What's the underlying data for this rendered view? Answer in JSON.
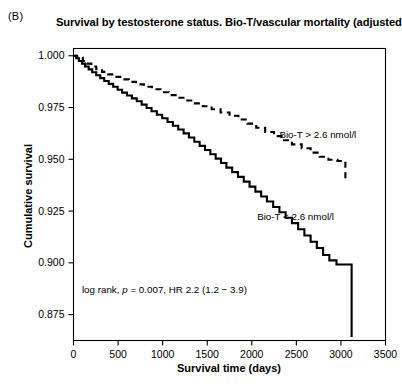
{
  "panel": {
    "label": "(B)"
  },
  "chart_data": {
    "type": "line",
    "subtype": "kaplan-meier-survival",
    "title": "Survival by testosterone status. Bio-T/vascular mortality (adjusted)",
    "xlabel": "Survival time (days)",
    "ylabel": "Cumulative survival",
    "xlim": [
      0,
      3500
    ],
    "ylim": [
      0.8625,
      1.0035
    ],
    "xticks": [
      0,
      500,
      1000,
      1500,
      2000,
      2500,
      3000,
      3500
    ],
    "xtick_labels": [
      "0",
      "500",
      "1000",
      "1500",
      "2000",
      "2500",
      "3000",
      "3500"
    ],
    "yticks": [
      1.0,
      0.975,
      0.95,
      0.925,
      0.9,
      0.875
    ],
    "ytick_labels": [
      "1.000",
      "0.975",
      "0.950",
      "0.925",
      "0.900",
      "0.875"
    ],
    "grid": false,
    "legend_position": "inline-annotation",
    "series": [
      {
        "name": "Bio-T > 2.6 nmol/l",
        "style": "dashed",
        "color": "#000000",
        "label_x": 2310,
        "label_y": 0.9605,
        "points": [
          [
            0,
            1.0
          ],
          [
            40,
            0.9995
          ],
          [
            70,
            0.999
          ],
          [
            105,
            0.9975
          ],
          [
            150,
            0.9962
          ],
          [
            200,
            0.9948
          ],
          [
            255,
            0.9935
          ],
          [
            320,
            0.9922
          ],
          [
            390,
            0.991
          ],
          [
            460,
            0.9898
          ],
          [
            540,
            0.9886
          ],
          [
            620,
            0.9874
          ],
          [
            700,
            0.9862
          ],
          [
            790,
            0.985
          ],
          [
            880,
            0.9838
          ],
          [
            975,
            0.9824
          ],
          [
            1070,
            0.981
          ],
          [
            1160,
            0.9797
          ],
          [
            1255,
            0.9784
          ],
          [
            1350,
            0.977
          ],
          [
            1450,
            0.9756
          ],
          [
            1550,
            0.9742
          ],
          [
            1650,
            0.9726
          ],
          [
            1750,
            0.971
          ],
          [
            1850,
            0.9692
          ],
          [
            1950,
            0.9672
          ],
          [
            2050,
            0.9652
          ],
          [
            2150,
            0.9632
          ],
          [
            2250,
            0.9612
          ],
          [
            2350,
            0.9592
          ],
          [
            2450,
            0.9572
          ],
          [
            2560,
            0.9553
          ],
          [
            2660,
            0.9532
          ],
          [
            2760,
            0.9512
          ],
          [
            2860,
            0.9498
          ],
          [
            2960,
            0.9492
          ],
          [
            3050,
            0.949
          ],
          [
            3050,
            0.9398
          ]
        ]
      },
      {
        "name": "Bio-T < 2.6 nmol/l",
        "style": "solid",
        "color": "#000000",
        "label_x": 2060,
        "label_y": 0.9205,
        "points": [
          [
            0,
            1.0
          ],
          [
            30,
            0.9988
          ],
          [
            60,
            0.9975
          ],
          [
            95,
            0.9962
          ],
          [
            130,
            0.9948
          ],
          [
            170,
            0.9934
          ],
          [
            210,
            0.992
          ],
          [
            255,
            0.9906
          ],
          [
            300,
            0.9892
          ],
          [
            345,
            0.9878
          ],
          [
            395,
            0.9864
          ],
          [
            445,
            0.985
          ],
          [
            495,
            0.9836
          ],
          [
            545,
            0.9822
          ],
          [
            600,
            0.9808
          ],
          [
            655,
            0.9794
          ],
          [
            710,
            0.978
          ],
          [
            765,
            0.9764
          ],
          [
            820,
            0.9748
          ],
          [
            875,
            0.9732
          ],
          [
            935,
            0.9715
          ],
          [
            995,
            0.9698
          ],
          [
            1055,
            0.968
          ],
          [
            1115,
            0.9662
          ],
          [
            1175,
            0.9644
          ],
          [
            1235,
            0.9625
          ],
          [
            1295,
            0.9605
          ],
          [
            1355,
            0.9585
          ],
          [
            1415,
            0.9565
          ],
          [
            1475,
            0.9545
          ],
          [
            1535,
            0.9524
          ],
          [
            1595,
            0.9503
          ],
          [
            1655,
            0.9482
          ],
          [
            1715,
            0.946
          ],
          [
            1780,
            0.9438
          ],
          [
            1845,
            0.9415
          ],
          [
            1910,
            0.9392
          ],
          [
            1975,
            0.9368
          ],
          [
            2040,
            0.9344
          ],
          [
            2105,
            0.932
          ],
          [
            2170,
            0.9296
          ],
          [
            2240,
            0.927
          ],
          [
            2310,
            0.9244
          ],
          [
            2380,
            0.9218
          ],
          [
            2450,
            0.9192
          ],
          [
            2520,
            0.9162
          ],
          [
            2590,
            0.9132
          ],
          [
            2660,
            0.9102
          ],
          [
            2730,
            0.9072
          ],
          [
            2800,
            0.9038
          ],
          [
            2870,
            0.9012
          ],
          [
            2950,
            0.8992
          ],
          [
            3120,
            0.8988
          ],
          [
            3120,
            0.8642
          ]
        ]
      }
    ],
    "annotations": [
      {
        "name": "log-rank-statistics",
        "text_prefix": "log rank, ",
        "text_italic": "p",
        "text_suffix": " = 0.007, HR 2.2 (1.2 − 3.9)",
        "x": 1020,
        "y": 0.8855
      }
    ]
  }
}
